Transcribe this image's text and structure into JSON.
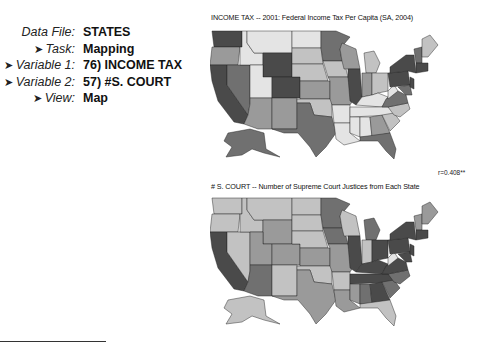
{
  "info": {
    "data_file_label": "Data File:",
    "data_file_value": "STATES",
    "task_label": "Task:",
    "task_value": "Mapping",
    "variable1_label": "Variable 1:",
    "variable1_value": "76) INCOME TAX",
    "variable2_label": "Variable 2:",
    "variable2_value": "57) #S. COURT",
    "view_label": "View:",
    "view_value": "Map",
    "arrow_glyph": "➤"
  },
  "maps": {
    "top": {
      "title": "INCOME TAX -- 2001: Federal Income Tax Per Capita (SA, 2004)",
      "type": "choropleth-grayscale"
    },
    "correlation": "r=0.408**",
    "bottom": {
      "title": "# S. COURT -- Number of Supreme Court Justices from Each State",
      "type": "choropleth-grayscale"
    }
  },
  "colors": {
    "shade1": "#e4e4e4",
    "shade2": "#c2c2c2",
    "shade3": "#9a9a9a",
    "shade4": "#707070",
    "shade5": "#4a4a4a",
    "border": "#222222"
  }
}
